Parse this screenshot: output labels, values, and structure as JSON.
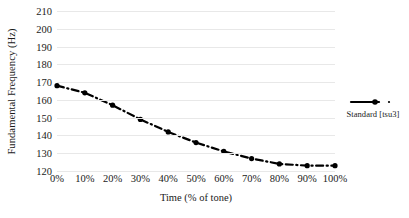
{
  "chart_data": {
    "type": "line",
    "title": "",
    "xlabel": "Time (% of tone)",
    "ylabel": "Fundamental Frequency (Hz)",
    "categories": [
      "0%",
      "10%",
      "20%",
      "30%",
      "40%",
      "50%",
      "60%",
      "70%",
      "80%",
      "90%",
      "100%"
    ],
    "x": [
      0,
      10,
      20,
      30,
      40,
      50,
      60,
      70,
      80,
      90,
      100
    ],
    "xlim": [
      0,
      100
    ],
    "ylim": [
      120,
      210
    ],
    "ytick_labels": [
      "120",
      "130",
      "140",
      "150",
      "160",
      "170",
      "180",
      "190",
      "200",
      "210"
    ],
    "yticks": [
      120,
      130,
      140,
      150,
      160,
      170,
      180,
      190,
      200,
      210
    ],
    "grid": "horizontal",
    "legend_position": "right",
    "series": [
      {
        "name": "Standard [tsu3]",
        "values": [
          168,
          164,
          157,
          149,
          142,
          136,
          131,
          127,
          124,
          123,
          123
        ],
        "color": "#000000",
        "line_style": "dash-dot",
        "marker": "diamond"
      }
    ]
  },
  "legend": {
    "entries": [
      {
        "label": "Standard [tsu3]",
        "swatch_name": "legend-swatch-standard"
      }
    ]
  }
}
